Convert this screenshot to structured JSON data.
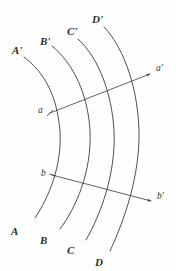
{
  "figure": {
    "type": "geometric-diagram",
    "background_color": "#fefefe",
    "stroke_color": "#3a3a3a",
    "width": 176,
    "height": 271
  },
  "curves": [
    {
      "id": "curve-A",
      "start_label": "A'",
      "end_label": "A",
      "start_label_pos": {
        "x": 12,
        "y": 45
      },
      "end_label_pos": {
        "x": 11,
        "y": 226
      },
      "path": "M 24,57 C 44,72 57,95 60,131 C 62,166 49,197 35,218"
    },
    {
      "id": "curve-B",
      "start_label": "B'",
      "end_label": "B",
      "start_label_pos": {
        "x": 40,
        "y": 36
      },
      "end_label_pos": {
        "x": 40,
        "y": 235
      },
      "path": "M 52,46 C 74,64 88,95 90,131 C 92,171 76,208 60,229"
    },
    {
      "id": "curve-C",
      "start_label": "C'",
      "end_label": "C",
      "start_label_pos": {
        "x": 67,
        "y": 26
      },
      "end_label_pos": {
        "x": 67,
        "y": 245
      },
      "path": "M 78,39 C 99,58 112,94 114,131 C 116,173 101,214 86,240"
    },
    {
      "id": "curve-D",
      "start_label": "D'",
      "end_label": "D",
      "start_label_pos": {
        "x": 92,
        "y": 14
      },
      "end_label_pos": {
        "x": 95,
        "y": 257
      },
      "path": "M 104,27 C 126,50 138,92 139,131 C 140,176 124,221 110,251"
    }
  ],
  "rays": [
    {
      "id": "ray-a",
      "start_label": "a",
      "end_label": "a'",
      "start_label_pos": {
        "x": 38,
        "y": 106
      },
      "end_label_pos": {
        "x": 156,
        "y": 64
      },
      "line": {
        "x1": 50,
        "y1": 113,
        "x2": 150,
        "y2": 74
      },
      "tick": {
        "x1": 47,
        "y1": 116,
        "x2": 53,
        "y2": 110
      },
      "arrow_angle_deg": -21.3
    },
    {
      "id": "ray-b",
      "start_label": "b",
      "end_label": "b'",
      "start_label_pos": {
        "x": 41,
        "y": 169
      },
      "end_label_pos": {
        "x": 157,
        "y": 192
      },
      "line": {
        "x1": 52,
        "y1": 175,
        "x2": 151,
        "y2": 201
      },
      "tick": {
        "x1": 49,
        "y1": 174,
        "x2": 56,
        "y2": 176
      },
      "arrow_angle_deg": 14.7
    }
  ]
}
